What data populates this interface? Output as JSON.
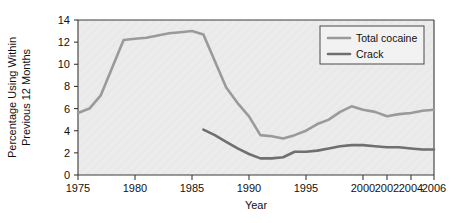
{
  "chart_data": {
    "type": "line",
    "title": "",
    "xlabel": "Year",
    "ylabel": "Percentage Using Within Previous 12 Months",
    "ylabel_line1": "Percentage Using Within",
    "ylabel_line2": "Previous 12 Months",
    "ylim": [
      0,
      14
    ],
    "ytick_step": 2,
    "yticks": [
      0,
      2,
      4,
      6,
      8,
      10,
      12,
      14
    ],
    "xticks": [
      1975,
      1980,
      1985,
      1990,
      1995,
      2000,
      2002,
      2004,
      2006
    ],
    "xlim": [
      1975,
      2006
    ],
    "grid": false,
    "legend_position": "top-right",
    "legend_entries": [
      "Total cocaine",
      "Crack"
    ],
    "plot_background": "#e9e9e9",
    "series": [
      {
        "name": "Total cocaine",
        "color": "#9a9a9a",
        "width": 2.6,
        "x": [
          1975,
          1976,
          1977,
          1979,
          1980,
          1981,
          1982,
          1983,
          1984,
          1985,
          1986,
          1987,
          1988,
          1989,
          1990,
          1991,
          1992,
          1993,
          1994,
          1995,
          1996,
          1997,
          1998,
          1999,
          2000,
          2001,
          2002,
          2003,
          2004,
          2005,
          2006
        ],
        "values": [
          5.6,
          6.0,
          7.2,
          12.2,
          12.3,
          12.4,
          12.6,
          12.8,
          12.9,
          13.0,
          12.7,
          10.3,
          7.9,
          6.5,
          5.3,
          3.6,
          3.5,
          3.3,
          3.6,
          4.0,
          4.6,
          5.0,
          5.7,
          6.2,
          5.9,
          5.7,
          5.3,
          5.5,
          5.6,
          5.8,
          5.9
        ]
      },
      {
        "name": "Crack",
        "color": "#6f6f6f",
        "width": 2.6,
        "x": [
          1986,
          1987,
          1988,
          1989,
          1990,
          1991,
          1992,
          1993,
          1994,
          1995,
          1996,
          1997,
          1998,
          1999,
          2000,
          2001,
          2002,
          2003,
          2004,
          2005,
          2006
        ],
        "values": [
          4.1,
          3.6,
          3.0,
          2.4,
          1.9,
          1.5,
          1.5,
          1.6,
          2.1,
          2.1,
          2.2,
          2.4,
          2.6,
          2.7,
          2.7,
          2.6,
          2.5,
          2.5,
          2.4,
          2.3,
          2.3
        ]
      }
    ]
  },
  "geometry": {
    "plot_left": 78,
    "plot_right": 434,
    "plot_top": 20,
    "plot_bottom": 175,
    "x_tick_positions": [
      78,
      135,
      192,
      249,
      306,
      363,
      387,
      411,
      434
    ]
  }
}
